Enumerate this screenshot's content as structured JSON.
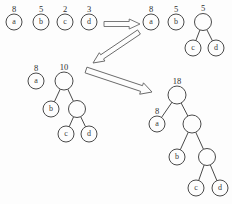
{
  "diagram": {
    "background_color": "#fdfdfd",
    "stroke_color": "#4a4a4a",
    "stages": [
      {
        "id": "stage-1",
        "name": "initial-forest",
        "nodes": [
          {
            "id": "s1-a",
            "label": "a",
            "weight": "8",
            "cx": 14,
            "cy": 22,
            "r": 8,
            "leaf": true
          },
          {
            "id": "s1-b",
            "label": "b",
            "weight": "5",
            "cx": 41,
            "cy": 22,
            "r": 8,
            "leaf": true
          },
          {
            "id": "s1-c",
            "label": "c",
            "weight": "2",
            "cx": 65,
            "cy": 22,
            "r": 8,
            "leaf": true
          },
          {
            "id": "s1-d",
            "label": "d",
            "weight": "3",
            "cx": 89,
            "cy": 22,
            "r": 8,
            "leaf": true
          }
        ],
        "edges": []
      },
      {
        "id": "stage-2",
        "name": "merge-c-d",
        "nodes": [
          {
            "id": "s2-a",
            "label": "a",
            "weight": "8",
            "cx": 151,
            "cy": 22,
            "r": 8,
            "leaf": true
          },
          {
            "id": "s2-b",
            "label": "b",
            "weight": "5",
            "cx": 176,
            "cy": 22,
            "r": 8,
            "leaf": true
          },
          {
            "id": "s2-cd",
            "label": "",
            "weight": "5",
            "cx": 203,
            "cy": 22,
            "r": 8.5,
            "leaf": false
          },
          {
            "id": "s2-c",
            "label": "c",
            "weight": "",
            "cx": 193,
            "cy": 48,
            "r": 8,
            "leaf": true
          },
          {
            "id": "s2-d",
            "label": "d",
            "weight": "",
            "cx": 216,
            "cy": 48,
            "r": 8,
            "leaf": true
          }
        ],
        "edges": [
          {
            "from": "s2-cd",
            "to": "s2-c"
          },
          {
            "from": "s2-cd",
            "to": "s2-d"
          }
        ]
      },
      {
        "id": "stage-3",
        "name": "merge-b-with-cd",
        "nodes": [
          {
            "id": "s3-a",
            "label": "a",
            "weight": "8",
            "cx": 36,
            "cy": 81,
            "r": 8,
            "leaf": true
          },
          {
            "id": "s3-bcd",
            "label": "",
            "weight": "10",
            "cx": 64,
            "cy": 81,
            "r": 9,
            "leaf": false
          },
          {
            "id": "s3-b",
            "label": "b",
            "weight": "",
            "cx": 51,
            "cy": 109,
            "r": 8,
            "leaf": true
          },
          {
            "id": "s3-cd",
            "label": "",
            "weight": "",
            "cx": 77,
            "cy": 109,
            "r": 8.5,
            "leaf": false
          },
          {
            "id": "s3-c",
            "label": "c",
            "weight": "",
            "cx": 66,
            "cy": 134,
            "r": 8,
            "leaf": true
          },
          {
            "id": "s3-d",
            "label": "d",
            "weight": "",
            "cx": 89,
            "cy": 134,
            "r": 8,
            "leaf": true
          }
        ],
        "edges": [
          {
            "from": "s3-bcd",
            "to": "s3-b"
          },
          {
            "from": "s3-bcd",
            "to": "s3-cd"
          },
          {
            "from": "s3-cd",
            "to": "s3-c"
          },
          {
            "from": "s3-cd",
            "to": "s3-d"
          }
        ]
      },
      {
        "id": "stage-4",
        "name": "final-huffman-tree",
        "nodes": [
          {
            "id": "s4-root",
            "label": "",
            "weight": "18",
            "cx": 177,
            "cy": 95,
            "r": 9,
            "leaf": false
          },
          {
            "id": "s4-a",
            "label": "a",
            "weight": "8",
            "cx": 157,
            "cy": 124,
            "r": 8,
            "leaf": true
          },
          {
            "id": "s4-bcd",
            "label": "",
            "weight": "",
            "cx": 192,
            "cy": 124,
            "r": 9,
            "leaf": false
          },
          {
            "id": "s4-b",
            "label": "b",
            "weight": "",
            "cx": 177,
            "cy": 157,
            "r": 8,
            "leaf": true
          },
          {
            "id": "s4-cd",
            "label": "",
            "weight": "",
            "cx": 207,
            "cy": 157,
            "r": 8.5,
            "leaf": false
          },
          {
            "id": "s4-c",
            "label": "c",
            "weight": "",
            "cx": 196,
            "cy": 188,
            "r": 8,
            "leaf": true
          },
          {
            "id": "s4-d",
            "label": "d",
            "weight": "",
            "cx": 220,
            "cy": 188,
            "r": 8,
            "leaf": true
          }
        ],
        "edges": [
          {
            "from": "s4-root",
            "to": "s4-a"
          },
          {
            "from": "s4-root",
            "to": "s4-bcd"
          },
          {
            "from": "s4-bcd",
            "to": "s4-b"
          },
          {
            "from": "s4-bcd",
            "to": "s4-cd"
          },
          {
            "from": "s4-cd",
            "to": "s4-c"
          },
          {
            "from": "s4-cd",
            "to": "s4-d"
          }
        ]
      }
    ],
    "arrows": [
      {
        "id": "arrow-1",
        "name": "arrow-stage1-to-stage2",
        "direction": "right",
        "x1": 104,
        "y1": 24,
        "x2": 140,
        "y2": 24,
        "thickness": 5
      },
      {
        "id": "arrow-2",
        "name": "arrow-stage2-to-stage3",
        "direction": "down-left",
        "x1": 139,
        "y1": 32,
        "x2": 93,
        "y2": 63,
        "thickness": 5
      },
      {
        "id": "arrow-3",
        "name": "arrow-stage3-to-stage4",
        "direction": "down-right",
        "x1": 86,
        "y1": 70,
        "x2": 152,
        "y2": 92,
        "thickness": 6
      }
    ]
  }
}
